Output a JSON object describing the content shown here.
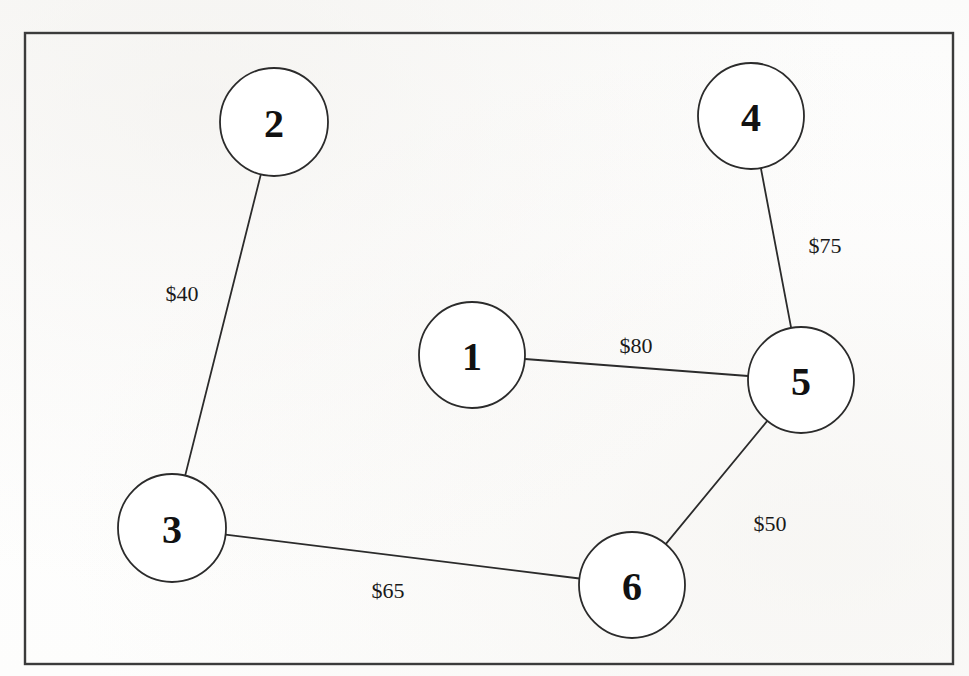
{
  "figure": {
    "type": "weighted-undirected-graph",
    "background_color": "#fdfdfc",
    "frame": {
      "x": 25,
      "y": 33,
      "width": 928,
      "height": 631,
      "stroke": "#3b3b3b",
      "stroke_width": 2.4
    },
    "node_stroke": "#2b2b2b",
    "node_fill": "#ffffff",
    "edge_stroke": "#2b2b2b"
  },
  "chart_data": {
    "type": "diagram",
    "title": "",
    "nodes": [
      {
        "id": "1",
        "label": "1",
        "cx": 472,
        "cy": 355,
        "r": 53
      },
      {
        "id": "2",
        "label": "2",
        "cx": 274,
        "cy": 122,
        "r": 54
      },
      {
        "id": "3",
        "label": "3",
        "cx": 172,
        "cy": 528,
        "r": 54
      },
      {
        "id": "4",
        "label": "4",
        "cx": 751,
        "cy": 116,
        "r": 53
      },
      {
        "id": "5",
        "label": "5",
        "cx": 801,
        "cy": 380,
        "r": 53
      },
      {
        "id": "6",
        "label": "6",
        "cx": 632,
        "cy": 585,
        "r": 53
      }
    ],
    "edges": [
      {
        "id": "edge-2-3",
        "source": "2",
        "target": "3",
        "weight": 40,
        "label": "$40",
        "label_x": 182,
        "label_y": 293
      },
      {
        "id": "edge-4-5",
        "source": "4",
        "target": "5",
        "weight": 75,
        "label": "$75",
        "label_x": 825,
        "label_y": 245
      },
      {
        "id": "edge-1-5",
        "source": "1",
        "target": "5",
        "weight": 80,
        "label": "$80",
        "label_x": 636,
        "label_y": 345
      },
      {
        "id": "edge-5-6",
        "source": "5",
        "target": "6",
        "weight": 50,
        "label": "$50",
        "label_x": 770,
        "label_y": 523
      },
      {
        "id": "edge-3-6",
        "source": "3",
        "target": "6",
        "weight": 65,
        "label": "$65",
        "label_x": 388,
        "label_y": 590
      }
    ],
    "legend": [],
    "annotations": []
  }
}
